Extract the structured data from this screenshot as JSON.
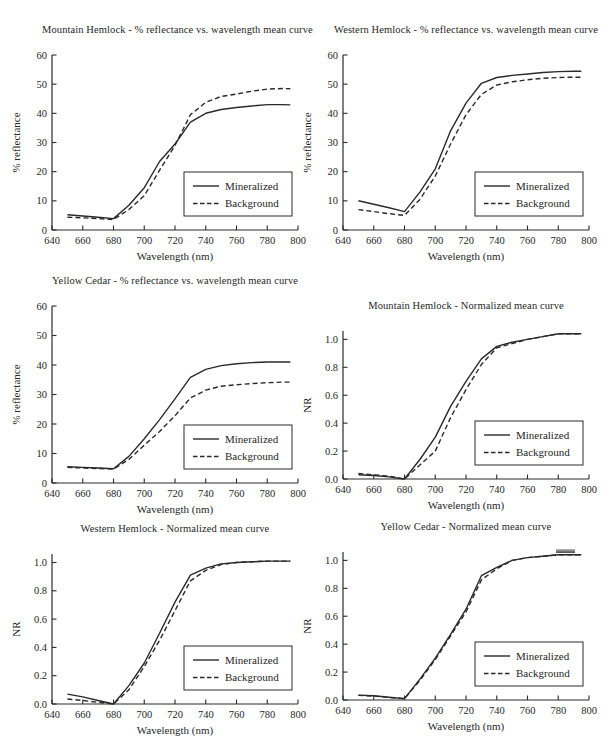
{
  "page": {
    "background": "#ffffff",
    "text_color": "#262626",
    "line_color": "#2a2a2a",
    "axis_color": "#2a2a2a"
  },
  "chart_data": [
    {
      "type": "line",
      "title": "Mountain Hemlock - % reflectance vs. wavelength mean curve",
      "xlabel": "Wavelength (nm)",
      "ylabel": "% reflectance",
      "xlim": [
        640,
        800
      ],
      "ylim": [
        0,
        60
      ],
      "xticks": [
        640,
        660,
        680,
        700,
        720,
        740,
        760,
        780,
        800
      ],
      "xtick_labels": [
        "640",
        "660",
        "680",
        "700",
        "720",
        "740",
        "760",
        "780",
        "800"
      ],
      "yticks": [
        0,
        10,
        20,
        30,
        40,
        50,
        60
      ],
      "ytick_labels": [
        "0",
        "10",
        "20",
        "30",
        "40",
        "50",
        "60"
      ],
      "grid": false,
      "legend_position": "bottom-right",
      "x": [
        650,
        660,
        670,
        680,
        690,
        700,
        710,
        720,
        730,
        740,
        750,
        760,
        770,
        780,
        790,
        795
      ],
      "series": [
        {
          "name": "Mineralized",
          "line": "solid",
          "values": [
            5.2,
            4.8,
            4.4,
            3.9,
            8.5,
            14.5,
            23.5,
            29.5,
            37.0,
            40.0,
            41.3,
            42.0,
            42.5,
            43.0,
            43.0,
            42.9
          ]
        },
        {
          "name": "Background",
          "line": "dashed",
          "values": [
            4.4,
            4.2,
            3.9,
            3.6,
            7.0,
            11.8,
            20.5,
            29.0,
            39.5,
            43.8,
            45.8,
            46.6,
            47.6,
            48.3,
            48.5,
            48.4
          ]
        }
      ]
    },
    {
      "type": "line",
      "title": "Western Hemlock - % reflectance vs. wavelength mean curve",
      "xlabel": "Wavelength (nm)",
      "ylabel": "% reflectance",
      "xlim": [
        640,
        800
      ],
      "ylim": [
        0,
        60
      ],
      "xticks": [
        640,
        660,
        680,
        700,
        720,
        740,
        760,
        780,
        800
      ],
      "xtick_labels": [
        "640",
        "660",
        "680",
        "700",
        "720",
        "740",
        "760",
        "780",
        "800"
      ],
      "yticks": [
        0,
        10,
        20,
        30,
        40,
        50,
        60
      ],
      "ytick_labels": [
        "0",
        "10",
        "20",
        "30",
        "40",
        "50",
        "60"
      ],
      "grid": false,
      "legend_position": "bottom-right",
      "x": [
        650,
        660,
        670,
        680,
        690,
        700,
        710,
        720,
        730,
        740,
        750,
        760,
        770,
        780,
        790,
        795
      ],
      "series": [
        {
          "name": "Mineralized",
          "line": "solid",
          "values": [
            10.0,
            8.8,
            7.6,
            6.3,
            13.0,
            21.0,
            34.0,
            43.5,
            50.3,
            52.3,
            53.0,
            53.5,
            54.0,
            54.3,
            54.4,
            54.4
          ]
        },
        {
          "name": "Background",
          "line": "dashed",
          "values": [
            7.0,
            6.3,
            5.6,
            5.0,
            10.5,
            18.5,
            29.5,
            39.5,
            46.5,
            49.7,
            50.8,
            51.5,
            52.0,
            52.3,
            52.4,
            52.4
          ]
        }
      ]
    },
    {
      "type": "line",
      "title": "Yellow Cedar - % reflectance vs. wavelength mean curve",
      "xlabel": "Wavelength (nm)",
      "ylabel": "% reflectance",
      "xlim": [
        640,
        800
      ],
      "ylim": [
        0,
        60
      ],
      "xticks": [
        640,
        660,
        680,
        700,
        720,
        740,
        760,
        780,
        800
      ],
      "xtick_labels": [
        "640",
        "660",
        "680",
        "700",
        "720",
        "740",
        "760",
        "780",
        "800"
      ],
      "yticks": [
        0,
        10,
        20,
        30,
        40,
        50,
        60
      ],
      "ytick_labels": [
        "0",
        "10",
        "20",
        "30",
        "40",
        "50",
        "60"
      ],
      "grid": false,
      "legend_position": "bottom-right",
      "x": [
        650,
        660,
        670,
        680,
        690,
        700,
        710,
        720,
        730,
        740,
        750,
        760,
        770,
        780,
        790,
        795
      ],
      "series": [
        {
          "name": "Mineralized",
          "line": "solid",
          "values": [
            5.5,
            5.3,
            5.1,
            4.8,
            9.0,
            15.0,
            21.5,
            28.5,
            35.8,
            38.5,
            39.8,
            40.4,
            40.8,
            41.0,
            41.0,
            41.0
          ]
        },
        {
          "name": "Background",
          "line": "dashed",
          "values": [
            5.3,
            5.1,
            4.9,
            4.7,
            8.0,
            12.8,
            17.5,
            22.8,
            28.8,
            31.5,
            32.8,
            33.3,
            33.7,
            34.0,
            34.2,
            34.2
          ]
        }
      ]
    },
    {
      "type": "line",
      "title": "Mountain Hemlock - Normalized mean curve",
      "xlabel": "Wavelength (nm)",
      "ylabel": "NR",
      "xlim": [
        640,
        800
      ],
      "ylim": [
        0,
        1.06
      ],
      "xticks": [
        640,
        660,
        680,
        700,
        720,
        740,
        760,
        780,
        800
      ],
      "xtick_labels": [
        "640",
        "660",
        "680",
        "700",
        "720",
        "740",
        "760",
        "780",
        "800"
      ],
      "yticks": [
        0,
        0.2,
        0.4,
        0.6,
        0.8,
        1.0
      ],
      "ytick_labels": [
        "0.0",
        "0.2",
        "0.4",
        "0.6",
        "0.8",
        "1.0"
      ],
      "grid": false,
      "legend_position": "bottom-right",
      "x": [
        650,
        660,
        670,
        680,
        690,
        700,
        710,
        720,
        730,
        740,
        750,
        760,
        770,
        780,
        790,
        795
      ],
      "series": [
        {
          "name": "Mineralized",
          "line": "solid",
          "values": [
            0.03,
            0.025,
            0.015,
            0.0,
            0.14,
            0.3,
            0.52,
            0.7,
            0.86,
            0.95,
            0.98,
            1.0,
            1.02,
            1.04,
            1.04,
            1.04
          ]
        },
        {
          "name": "Background",
          "line": "dashed",
          "values": [
            0.04,
            0.03,
            0.02,
            0.0,
            0.1,
            0.2,
            0.44,
            0.64,
            0.82,
            0.94,
            0.97,
            1.0,
            1.02,
            1.04,
            1.04,
            1.04
          ]
        }
      ]
    },
    {
      "type": "line",
      "title": "Western Hemlock - Normalized mean curve",
      "xlabel": "Wavelength (nm)",
      "ylabel": "NR",
      "xlim": [
        640,
        800
      ],
      "ylim": [
        0,
        1.06
      ],
      "xticks": [
        640,
        660,
        680,
        700,
        720,
        740,
        760,
        780,
        800
      ],
      "xtick_labels": [
        "640",
        "660",
        "680",
        "700",
        "720",
        "740",
        "760",
        "780",
        "800"
      ],
      "yticks": [
        0,
        0.2,
        0.4,
        0.6,
        0.8,
        1.0
      ],
      "ytick_labels": [
        "0.0",
        "0.2",
        "0.4",
        "0.6",
        "0.8",
        "1.0"
      ],
      "grid": false,
      "legend_position": "bottom-right",
      "x": [
        650,
        660,
        670,
        680,
        690,
        700,
        710,
        720,
        730,
        740,
        750,
        760,
        770,
        780,
        790,
        795
      ],
      "series": [
        {
          "name": "Mineralized",
          "line": "solid",
          "values": [
            0.07,
            0.05,
            0.025,
            0.0,
            0.13,
            0.29,
            0.5,
            0.72,
            0.91,
            0.96,
            0.99,
            1.0,
            1.005,
            1.01,
            1.01,
            1.01
          ]
        },
        {
          "name": "Background",
          "line": "dashed",
          "values": [
            0.035,
            0.025,
            0.012,
            0.0,
            0.1,
            0.265,
            0.45,
            0.66,
            0.87,
            0.945,
            0.985,
            1.0,
            1.005,
            1.01,
            1.01,
            1.01
          ]
        }
      ]
    },
    {
      "type": "line",
      "title": "Yellow Cedar - Normalized mean curve",
      "xlabel": "Wavelength (nm)",
      "ylabel": "NR",
      "xlim": [
        640,
        800
      ],
      "ylim": [
        0,
        1.06
      ],
      "xticks": [
        640,
        660,
        680,
        700,
        720,
        740,
        760,
        780,
        800
      ],
      "xtick_labels": [
        "640",
        "660",
        "680",
        "700",
        "720",
        "740",
        "760",
        "780",
        "800"
      ],
      "yticks": [
        0,
        0.2,
        0.4,
        0.6,
        0.8,
        1.0
      ],
      "ytick_labels": [
        "0.0",
        "0.2",
        "0.4",
        "0.6",
        "0.8",
        "1.0"
      ],
      "grid": false,
      "legend_position": "bottom-right",
      "x": [
        650,
        660,
        670,
        680,
        690,
        700,
        710,
        720,
        730,
        740,
        750,
        760,
        770,
        780,
        790,
        795
      ],
      "series": [
        {
          "name": "Mineralized",
          "line": "solid",
          "values": [
            0.035,
            0.03,
            0.02,
            0.01,
            0.15,
            0.3,
            0.47,
            0.65,
            0.89,
            0.95,
            1.0,
            1.02,
            1.03,
            1.04,
            1.04,
            1.04
          ]
        },
        {
          "name": "Background",
          "line": "dashed",
          "values": [
            0.033,
            0.028,
            0.018,
            0.01,
            0.14,
            0.29,
            0.46,
            0.63,
            0.86,
            0.94,
            1.0,
            1.02,
            1.03,
            1.04,
            1.04,
            1.04
          ]
        }
      ]
    }
  ]
}
